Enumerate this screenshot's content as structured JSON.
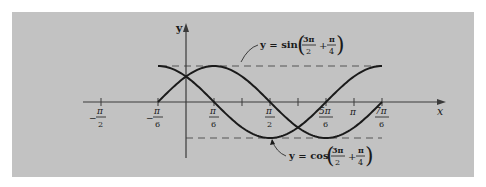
{
  "figure": {
    "background": "#c2c2c2",
    "page_background": "#ffffff",
    "ink": "#1a1a1a",
    "axis_color": "#3a3a3a",
    "dash_color": "#555555"
  },
  "axes": {
    "x_label": "x",
    "y_label": "y"
  },
  "ticks": [
    {
      "value": "-pi/2",
      "num": "π",
      "den": "2",
      "sign": "−",
      "px": 101
    },
    {
      "value": "-pi/6",
      "num": "π",
      "den": "6",
      "sign": "−",
      "px": 158
    },
    {
      "value": "pi/6",
      "num": "π",
      "den": "6",
      "sign": "",
      "px": 214
    },
    {
      "value": "pi/3",
      "num": "",
      "den": "",
      "sign": "",
      "px": 242
    },
    {
      "value": "pi/2",
      "num": "π",
      "den": "2",
      "sign": "",
      "px": 270
    },
    {
      "value": "2pi/3",
      "num": "",
      "den": "",
      "sign": "",
      "px": 298
    },
    {
      "value": "5pi/6",
      "num": "5π",
      "den": "6",
      "sign": "",
      "px": 326
    },
    {
      "value": "pi",
      "num": "π",
      "den": "",
      "sign": "",
      "px": 354
    },
    {
      "value": "7pi/6",
      "num": "7π",
      "den": "6",
      "sign": "",
      "px": 382
    }
  ],
  "labels": {
    "sin_curve": {
      "prefix": "y = sin",
      "frac1_num": "3π",
      "frac1_den": "2",
      "plus": "+",
      "frac2_num": "π",
      "frac2_den": "4"
    },
    "cos_curve": {
      "prefix": "y = cos",
      "frac1_num": "3π",
      "frac1_den": "2",
      "plus": "+",
      "frac2_num": "π",
      "frac2_den": "4"
    }
  },
  "chart_data": {
    "type": "line",
    "title": "",
    "xlabel": "x",
    "ylabel": "y",
    "xlim": [
      -1.8,
      4.3
    ],
    "ylim": [
      -1.4,
      1.5
    ],
    "grid": false,
    "x_ticks": [
      "-π/2",
      "-π/6",
      "π/6",
      "π/3",
      "π/2",
      "2π/3",
      "5π/6",
      "π",
      "7π/6"
    ],
    "reference_lines": [
      {
        "y": 1,
        "style": "dashed",
        "x_range": [
          "-π/6",
          "7π/6"
        ]
      },
      {
        "y": -1,
        "style": "dashed",
        "x_range": [
          "0",
          "7π/6"
        ]
      }
    ],
    "series": [
      {
        "name": "y = sin(3π/2 + π/4)",
        "function": "sin(3x/2 + π/4)",
        "domain": [
          "-π/6",
          "7π/6"
        ],
        "x": [
          "-π/6",
          "0",
          "π/6",
          "π/2",
          "5π/6",
          "7π/6"
        ],
        "values": [
          0,
          0.707,
          1,
          0,
          -1,
          0
        ]
      },
      {
        "name": "y = cos(3π/2 + π/4)",
        "function": "cos(3x/2 + π/4)",
        "domain": [
          "-π/6",
          "7π/6"
        ],
        "x": [
          "-π/6",
          "0",
          "π/6",
          "π/2",
          "5π/6",
          "7π/6"
        ],
        "values": [
          1,
          0.707,
          0,
          -1,
          0,
          1
        ]
      }
    ],
    "annotations": [
      "y = sin(3π/2 + π/4)",
      "y = cos(3π/2 + π/4)"
    ]
  }
}
